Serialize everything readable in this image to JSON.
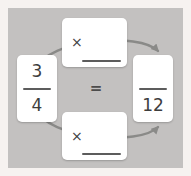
{
  "diagram": {
    "title_hint": "equivalent-fractions-cycle",
    "left_fraction": {
      "numerator": "3",
      "denominator": "4"
    },
    "equals_sign": "=",
    "right_fraction": {
      "numerator": "",
      "denominator": "12"
    },
    "top_operation": {
      "operator": "×",
      "blank_value": ""
    },
    "bottom_operation": {
      "operator": "×",
      "blank_value": ""
    },
    "colors": {
      "frame_background": "#f6f2f0",
      "panel_background": "#c3c1c0",
      "card_background": "#ffffff",
      "text": "#3d3d3d",
      "rule_line": "#5c5c5c",
      "arrow": "#8a8a88"
    }
  }
}
